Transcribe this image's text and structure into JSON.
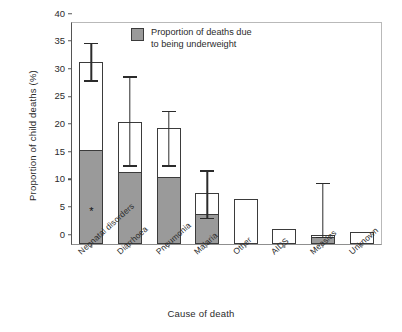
{
  "chart_data": {
    "type": "bar",
    "title": "",
    "subtitle": "",
    "xlabel": "Cause of death",
    "ylabel": "Proportion of child deaths (%)",
    "ylim": [
      0,
      40
    ],
    "yticks": [
      0,
      5,
      10,
      15,
      20,
      25,
      30,
      35,
      40
    ],
    "ytick_labels": [
      "0",
      "5",
      "10",
      "15",
      "20",
      "25",
      "30",
      "35",
      "40"
    ],
    "grid": false,
    "legend_position": "upper-center",
    "categories": [
      "Neonatal disorders",
      "Diarrhoea",
      "Pneumonia",
      "Malaria",
      "Other",
      "AIDS",
      "Measles",
      "Unknown"
    ],
    "series": [
      {
        "name": "Total proportion of child deaths",
        "values": [
          33.0,
          22.1,
          21.0,
          9.3,
          8.2,
          2.8,
          1.7,
          2.2
        ]
      },
      {
        "name": "Proportion of deaths due to being underweight",
        "values": [
          17.0,
          13.1,
          12.1,
          5.5,
          0,
          0,
          1.2,
          0
        ]
      }
    ],
    "error_bars": [
      {
        "category": "Neonatal disorders",
        "low": 29.5,
        "high": 36.3
      },
      {
        "category": "Diarrhoea",
        "low": 14.1,
        "high": 30.2
      },
      {
        "category": "Pneumonia",
        "low": 14.1,
        "high": 24.0
      },
      {
        "category": "Malaria",
        "low": 4.6,
        "high": 13.2
      },
      {
        "category": "Other",
        "low": null,
        "high": null
      },
      {
        "category": "AIDS",
        "low": null,
        "high": null
      },
      {
        "category": "Measles",
        "low": 1.2,
        "high": 11.0
      },
      {
        "category": "Unknown",
        "low": null,
        "high": null
      }
    ],
    "annotations": [
      {
        "category": "Neonatal disorders",
        "value": 6.0,
        "marker": "*"
      }
    ],
    "legend_entries": [
      {
        "label_line1": "Proportion of deaths due",
        "label_line2": "to being underweight",
        "color": "#9a9a9a"
      }
    ],
    "colors": {
      "underweight_fill": "#9a9a9a",
      "total_fill": "#ffffff",
      "bar_edge": "#3b3b3b",
      "axis": "#555555",
      "text": "#2b2b2b"
    }
  }
}
